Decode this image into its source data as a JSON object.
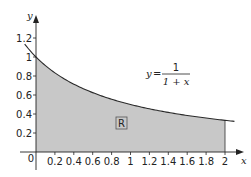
{
  "chart_data": {
    "type": "area",
    "title": "",
    "function": "y = 1/(1+x)",
    "xlabel": "x",
    "ylabel": "y",
    "xlim": [
      0,
      2.1
    ],
    "ylim": [
      0,
      1.3
    ],
    "x_ticks": [
      "0.2",
      "0.4",
      "0.6",
      "0.8",
      "1",
      "1.2",
      "1.4",
      "1.6",
      "1.8",
      "2"
    ],
    "y_ticks": [
      "0.2",
      "0.4",
      "0.6",
      "0.8",
      "1",
      "1.2"
    ],
    "origin_label": "0",
    "shaded_region": {
      "label": "R",
      "x_from": 0,
      "x_to": 2,
      "description": "area under y=1/(1+x) from x=0 to x=2"
    },
    "points": [
      {
        "x": -0.1,
        "y": 1.111
      },
      {
        "x": 0,
        "y": 1.0
      },
      {
        "x": 0.2,
        "y": 0.833
      },
      {
        "x": 0.4,
        "y": 0.714
      },
      {
        "x": 0.6,
        "y": 0.625
      },
      {
        "x": 0.8,
        "y": 0.556
      },
      {
        "x": 1.0,
        "y": 0.5
      },
      {
        "x": 1.2,
        "y": 0.455
      },
      {
        "x": 1.4,
        "y": 0.417
      },
      {
        "x": 1.6,
        "y": 0.385
      },
      {
        "x": 1.8,
        "y": 0.357
      },
      {
        "x": 2.0,
        "y": 0.333
      },
      {
        "x": 2.1,
        "y": 0.323
      }
    ],
    "colors": {
      "fill": "#c8c8c8",
      "curve": "#2a2a2a",
      "axis": "#222222"
    },
    "grid": false,
    "legend": null
  },
  "labels": {
    "equation_lhs": "y",
    "equation_eq": "=",
    "equation_num": "1",
    "equation_den": "1 + x",
    "region": "R",
    "x_axis": "x",
    "y_axis": "y",
    "origin": "0"
  }
}
